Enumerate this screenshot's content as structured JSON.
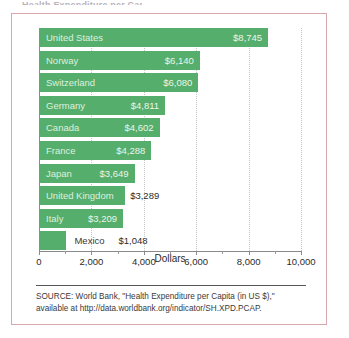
{
  "figure": {
    "title_sliver": "Health Expenditure per Capita, 2012",
    "x_axis_title": "Dollars",
    "source_line_1": "SOURCE: World Bank, \"Health Expenditure per Capita (in US $),\"",
    "source_line_2": "available at http://data.worldbank.org/indicator/SH.XPD.PCAP.",
    "border_color": "#d9a8ad",
    "bar_color": "#56ae6c"
  },
  "chart_data": {
    "type": "bar",
    "orientation": "horizontal",
    "title": "Health Expenditure per Capita, 2012",
    "xlabel": "Dollars",
    "ylabel": "",
    "xlim": [
      0,
      10000
    ],
    "grid": true,
    "legend": "none",
    "categories": [
      "United States",
      "Norway",
      "Switzerland",
      "Germany",
      "Canada",
      "France",
      "Japan",
      "United Kingdom",
      "Italy",
      "Mexico"
    ],
    "values": [
      8745,
      6140,
      6080,
      4811,
      4602,
      4288,
      3649,
      3289,
      3209,
      1048
    ],
    "value_labels": [
      "$8,745",
      "$6,140",
      "$6,080",
      "$4,811",
      "$4,602",
      "$4,288",
      "$3,649",
      "$3,289",
      "$3,209",
      "$1,048"
    ],
    "label_placement": [
      "inside",
      "inside",
      "inside",
      "inside",
      "inside",
      "inside",
      "inside",
      "outside",
      "inside",
      "outside"
    ],
    "xticks": [
      0,
      2000,
      4000,
      6000,
      8000,
      10000
    ],
    "xtick_labels": [
      "0",
      "2,000",
      "4,000",
      "6,000",
      "8,000",
      "10,000"
    ]
  }
}
